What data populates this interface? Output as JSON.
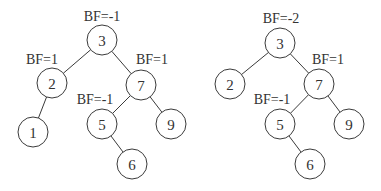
{
  "diagram": {
    "type": "binary-tree-comparison",
    "trees": [
      {
        "name": "left-tree",
        "nodes": [
          {
            "id": "3",
            "label": "3",
            "x": 102,
            "y": 40,
            "bf": "BF=-1",
            "bfx": 102,
            "bfy": 16
          },
          {
            "id": "2",
            "label": "2",
            "x": 52,
            "y": 83,
            "bf": "BF=1",
            "bfx": 42,
            "bfy": 59
          },
          {
            "id": "7",
            "label": "7",
            "x": 141,
            "y": 85,
            "bf": "BF=1",
            "bfx": 152,
            "bfy": 59
          },
          {
            "id": "1",
            "label": "1",
            "x": 33,
            "y": 132,
            "bf": "",
            "bfx": 0,
            "bfy": 0
          },
          {
            "id": "5",
            "label": "5",
            "x": 102,
            "y": 124,
            "bf": "BF=-1",
            "bfx": 95,
            "bfy": 99
          },
          {
            "id": "9",
            "label": "9",
            "x": 171,
            "y": 124,
            "bf": "",
            "bfx": 0,
            "bfy": 0
          },
          {
            "id": "6",
            "label": "6",
            "x": 132,
            "y": 164,
            "bf": "",
            "bfx": 0,
            "bfy": 0
          }
        ],
        "edges": [
          [
            "3",
            "2"
          ],
          [
            "3",
            "7"
          ],
          [
            "2",
            "1"
          ],
          [
            "7",
            "5"
          ],
          [
            "7",
            "9"
          ],
          [
            "5",
            "6"
          ]
        ]
      },
      {
        "name": "right-tree",
        "nodes": [
          {
            "id": "3",
            "label": "3",
            "x": 280,
            "y": 43,
            "bf": "BF=-2",
            "bfx": 281,
            "bfy": 18
          },
          {
            "id": "2",
            "label": "2",
            "x": 230,
            "y": 84,
            "bf": "",
            "bfx": 0,
            "bfy": 0
          },
          {
            "id": "7",
            "label": "7",
            "x": 319,
            "y": 84,
            "bf": "BF=1",
            "bfx": 328,
            "bfy": 59
          },
          {
            "id": "5",
            "label": "5",
            "x": 280,
            "y": 124,
            "bf": "BF=-1",
            "bfx": 272,
            "bfy": 99
          },
          {
            "id": "9",
            "label": "9",
            "x": 349,
            "y": 124,
            "bf": "",
            "bfx": 0,
            "bfy": 0
          },
          {
            "id": "6",
            "label": "6",
            "x": 310,
            "y": 164,
            "bf": "",
            "bfx": 0,
            "bfy": 0
          }
        ],
        "edges": [
          [
            "3",
            "2"
          ],
          [
            "3",
            "7"
          ],
          [
            "7",
            "5"
          ],
          [
            "7",
            "9"
          ],
          [
            "5",
            "6"
          ]
        ]
      }
    ],
    "node_radius": 15,
    "colors": {
      "stroke": "#3a3a3a",
      "text": "#333333",
      "background": "#ffffff"
    }
  }
}
